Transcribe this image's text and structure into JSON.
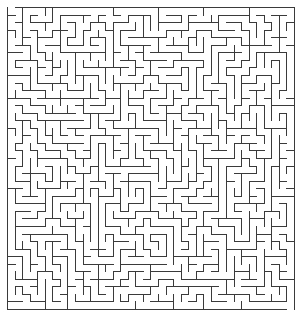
{
  "maze": {
    "cols": 38,
    "rows": 40,
    "cell_size": 7.55,
    "origin_x": 7,
    "origin_y": 7,
    "wall_color": "#3a3a3a",
    "background_color": "#ffffff",
    "entrance": {
      "side": "top",
      "col": 0
    },
    "exit": {
      "side": "bottom",
      "col": 37
    },
    "seed": 9173
  }
}
